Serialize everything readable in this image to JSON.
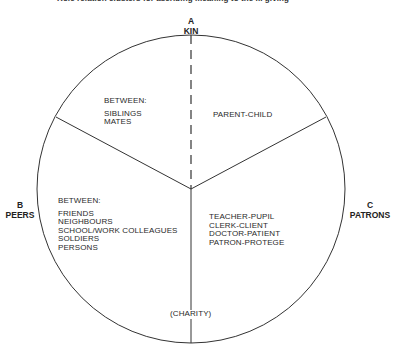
{
  "title": "Role relation clusters for ascribing meaning to the ... giving",
  "nodes": {
    "a": {
      "letter": "A",
      "name": "KIN"
    },
    "b": {
      "letter": "B",
      "name": "PEERS"
    },
    "c": {
      "letter": "C",
      "name": "PATRONS"
    }
  },
  "sectors": {
    "kin_peers": {
      "header": "BETWEEN:",
      "items": [
        "SIBLINGS",
        "MATES"
      ]
    },
    "kin_patrons": {
      "items": [
        "PARENT-CHILD"
      ]
    },
    "peers": {
      "header": "BETWEEN:",
      "items": [
        "FRIENDS",
        "NEIGHBOURS",
        "SCHOOL/WORK COLLEAGUES",
        "SOLDIERS",
        "PERSONS"
      ]
    },
    "patrons": {
      "items": [
        "TEACHER-PUPIL",
        "CLERK-CLIENT",
        "DOCTOR-PATIENT",
        "PATRON-PROTEGE"
      ]
    },
    "bottom": {
      "label": "(CHARITY)"
    }
  },
  "colors": {
    "line": "#333333",
    "text": "#222222",
    "background": "#ffffff"
  }
}
